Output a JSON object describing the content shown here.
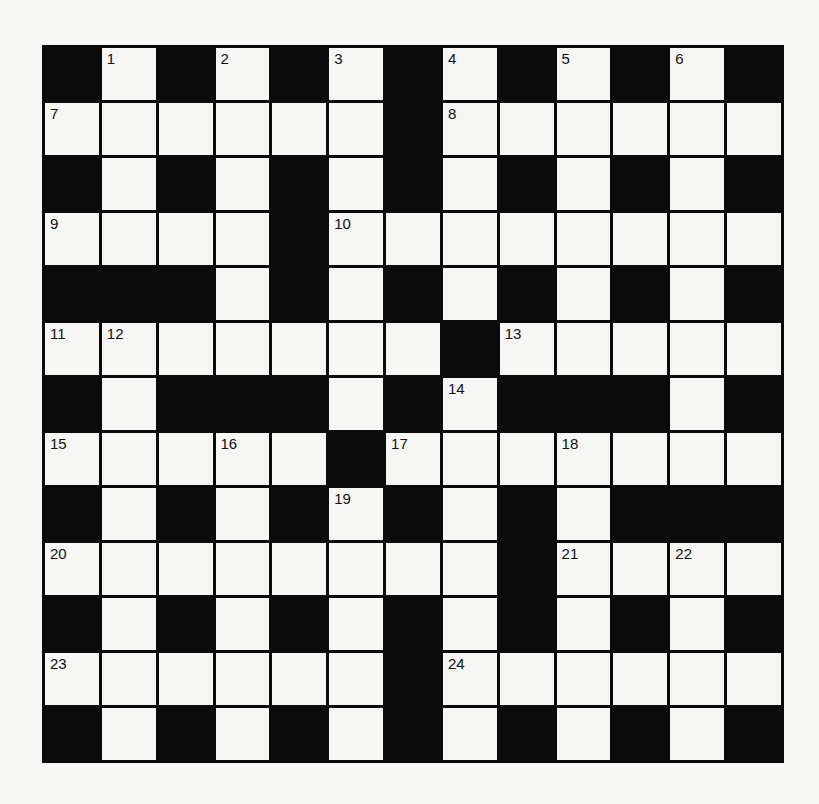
{
  "puzzle": {
    "rows": 13,
    "cols": 13,
    "colors": {
      "block": "#0b0b0b",
      "cell": "#f6f6f4",
      "background": "#f7f7f5"
    },
    "layout": [
      "#.#.#.#.#.#.#",
      "......#......",
      "#.#.#.#.#.#.#",
      "....#........",
      "###.#.#.#.#.#",
      ".......#.....",
      "#.###.#.###.#",
      ".....#.......",
      "#.#.#.#.#.###",
      "........#....",
      "#.#.#.#.#.#.#",
      "......#......",
      "#.#.#.#.#.#.#"
    ],
    "numbers": [
      {
        "r": 0,
        "c": 1,
        "n": "1"
      },
      {
        "r": 0,
        "c": 3,
        "n": "2"
      },
      {
        "r": 0,
        "c": 5,
        "n": "3"
      },
      {
        "r": 0,
        "c": 7,
        "n": "4"
      },
      {
        "r": 0,
        "c": 9,
        "n": "5"
      },
      {
        "r": 0,
        "c": 11,
        "n": "6"
      },
      {
        "r": 1,
        "c": 0,
        "n": "7"
      },
      {
        "r": 1,
        "c": 7,
        "n": "8"
      },
      {
        "r": 3,
        "c": 0,
        "n": "9"
      },
      {
        "r": 3,
        "c": 5,
        "n": "10"
      },
      {
        "r": 5,
        "c": 0,
        "n": "11"
      },
      {
        "r": 5,
        "c": 1,
        "n": "12"
      },
      {
        "r": 5,
        "c": 8,
        "n": "13"
      },
      {
        "r": 6,
        "c": 7,
        "n": "14"
      },
      {
        "r": 7,
        "c": 0,
        "n": "15"
      },
      {
        "r": 7,
        "c": 3,
        "n": "16"
      },
      {
        "r": 7,
        "c": 6,
        "n": "17"
      },
      {
        "r": 7,
        "c": 9,
        "n": "18"
      },
      {
        "r": 8,
        "c": 5,
        "n": "19"
      },
      {
        "r": 9,
        "c": 0,
        "n": "20"
      },
      {
        "r": 9,
        "c": 9,
        "n": "21"
      },
      {
        "r": 9,
        "c": 11,
        "n": "22"
      },
      {
        "r": 11,
        "c": 0,
        "n": "23"
      },
      {
        "r": 11,
        "c": 7,
        "n": "24"
      }
    ]
  }
}
